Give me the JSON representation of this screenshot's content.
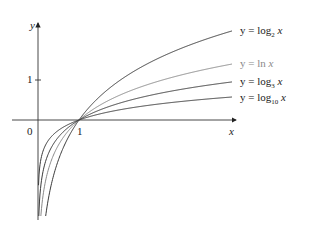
{
  "chart_data": {
    "type": "line",
    "title": "",
    "xlabel": "x",
    "ylabel": "y",
    "x_ticks": [
      {
        "value": 0,
        "label": "0"
      },
      {
        "value": 1,
        "label": "1"
      }
    ],
    "y_ticks": [
      {
        "value": 1,
        "label": "1"
      }
    ],
    "grid": false,
    "legend_position": "right (inline labels)",
    "series": [
      {
        "name": "y = log2 x",
        "base": 2,
        "color": "#3a3a3a",
        "label_parts": {
          "pre": "y = log",
          "sub": "2",
          "post": " x"
        }
      },
      {
        "name": "y = ln x",
        "base": 2.718281828,
        "color": "#8a8a8a",
        "label_parts": {
          "pre": "y = ln",
          "sub": "",
          "post": " x"
        }
      },
      {
        "name": "y = log3 x",
        "base": 3,
        "color": "#3a3a3a",
        "label_parts": {
          "pre": "y = log",
          "sub": "3",
          "post": " x"
        }
      },
      {
        "name": "y = log10 x",
        "base": 10,
        "color": "#3a3a3a",
        "label_parts": {
          "pre": "y = log",
          "sub": "10",
          "post": " x"
        }
      }
    ],
    "common_point": {
      "x": 1,
      "y": 0
    },
    "xlim": [
      0,
      4.7
    ],
    "ylim": [
      -2.4,
      2.4
    ]
  }
}
